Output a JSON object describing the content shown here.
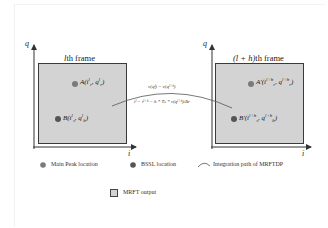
{
  "colors": {
    "frame_fill": "#d3d3d3",
    "frame_border": "#3a3a3a",
    "main_peak_dot": "#7a7a7a",
    "bssl_dot": "#555555",
    "path_line": "#555555"
  },
  "left_frame": {
    "title": "lth frame",
    "title_italic_part": "l",
    "title_rest": "th  frame",
    "axis_y": "q",
    "axis_x": "i",
    "point_a": {
      "name": "A",
      "coords": "(iᶜʳ, qᶜʳ)",
      "label_main": "A",
      "sub_i": "r",
      "sub_q": "r",
      "sup_i": "l",
      "sup_q": "l"
    },
    "point_b": {
      "name": "B",
      "label_main": "B",
      "sub_i": "s",
      "sub_q": "b",
      "sup_i": "l",
      "sup_q": "l"
    }
  },
  "right_frame": {
    "title": "(l+h)th frame",
    "title_math": "(l + h)",
    "title_rest": "th  frame",
    "axis_y": "q",
    "axis_x": "i",
    "point_a": {
      "name": "A'",
      "label_main": "A'",
      "sub_i": "r",
      "sub_q": "r",
      "sup_i": "l+h",
      "sup_q": "l+h"
    },
    "point_b": {
      "name": "B'",
      "label_main": "B'",
      "sub_i": "s",
      "sub_q": "b",
      "sup_i": "l+h",
      "sup_q": "l+h"
    }
  },
  "integration_path": {
    "equation_top": "v(qˡ) = v(qˡ⁺ʰ)",
    "equation_bottom": "iˡ = iˡ⁺ʰ − h * Tₛ * v(qˡ⁺ʰ)/Δr"
  },
  "legend": {
    "items": [
      {
        "icon": "main-peak-dot-icon",
        "label": "Main Peak location"
      },
      {
        "icon": "bssl-dot-icon",
        "label": "BSSL location"
      },
      {
        "icon": "integration-arc-icon",
        "label": "Integration path of MRFTDP"
      },
      {
        "icon": "mrft-output-square-icon",
        "label": "MRFT output"
      }
    ]
  }
}
